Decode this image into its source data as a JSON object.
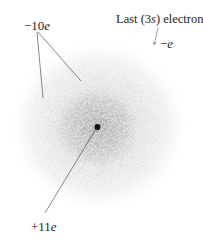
{
  "diagram": {
    "labels": {
      "inner_charge": "−10",
      "inner_charge_unit": "e",
      "nucleus_charge": "+11",
      "nucleus_charge_unit": "e",
      "last_electron_pre": "Last (3",
      "last_electron_italic": "s",
      "last_electron_post": ") electron",
      "electron_charge_sign": "−",
      "electron_charge_unit": "e"
    },
    "colors": {
      "text": "#231f20",
      "line": "#555555",
      "cloud": "#8c8c8c",
      "nucleus": "#111111",
      "electron_dot": "#9a9a9a"
    }
  }
}
